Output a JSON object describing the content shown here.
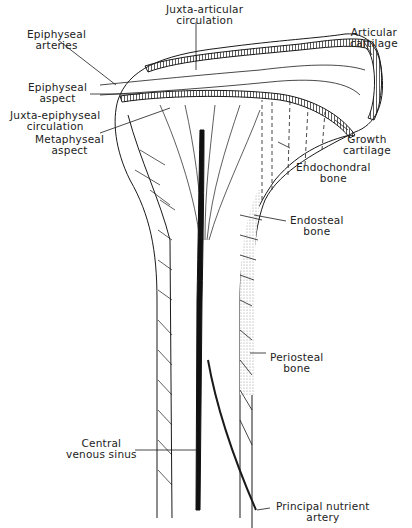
{
  "diagram": {
    "labels": {
      "juxta_articular": {
        "line1": "Juxta-articular",
        "line2": "circulation"
      },
      "epiphyseal_arteries": {
        "line1": "Epiphyseal",
        "line2": "arteries"
      },
      "articular_cartilage": {
        "line1": "Articular",
        "line2": "cartilage"
      },
      "epiphyseal_aspect": {
        "line1": "Epiphyseal",
        "line2": "aspect"
      },
      "juxta_epiphyseal": {
        "line1": "Juxta-epiphyseal",
        "line2": "circulation"
      },
      "metaphyseal_aspect": {
        "line1": "Metaphyseal",
        "line2": "aspect"
      },
      "growth_cartilage": {
        "line1": "Growth",
        "line2": "cartilage"
      },
      "endochondral_bone": {
        "line1": "Endochondral",
        "line2": "bone"
      },
      "endosteal_bone": {
        "line1": "Endosteal",
        "line2": "bone"
      },
      "periosteal_bone": {
        "line1": "Periosteal",
        "line2": "bone"
      },
      "central_venous_sinus": {
        "line1": "Central",
        "line2": "venous sinus"
      },
      "principal_nutrient_artery": {
        "line1": "Principal nutrient",
        "line2": "artery"
      }
    },
    "colors": {
      "ink": "#1a1a1a",
      "stipple": "#d8d8d8",
      "background": "#ffffff"
    }
  }
}
